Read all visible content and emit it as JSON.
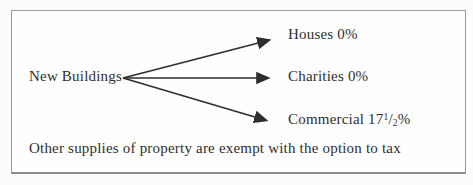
{
  "figure": {
    "root": {
      "label": "New Buildings"
    },
    "branches": [
      {
        "name": "houses",
        "label": "Houses 0%"
      },
      {
        "name": "charities",
        "label": "Charities 0%"
      },
      {
        "name": "commercial",
        "label_prefix": "Commercial 17",
        "fraction_numerator": "1",
        "fraction_slash": "/",
        "fraction_denominator": "2",
        "label_suffix": "%"
      }
    ],
    "footnote": "Other supplies of property are exempt with the option to tax"
  },
  "colors": {
    "text": "#2e2e2e",
    "arrow": "#2e2e2e",
    "frame_border": "#9a9a9a",
    "background": "#fefefe"
  }
}
